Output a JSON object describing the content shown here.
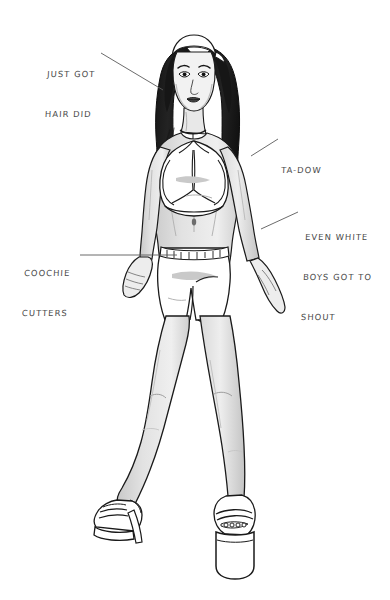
{
  "canvas": {
    "width": 390,
    "height": 600,
    "background_color": "#ffffff",
    "ink_color": "#1a1a1a",
    "annotation_text_color": "#4a4a4a",
    "leader_line_color": "#5a5a5a",
    "skin_shade_color": "#d6d6d6",
    "hair_color": "#1c1c1c",
    "garment_color": "#ffffff"
  },
  "artwork": {
    "title": "Woman in bandana, halter top and short shorts",
    "medium": "black and white ink illustration",
    "subject_parts": [
      "bandana-headband",
      "long-straight-hair",
      "face",
      "choker-necklace",
      "halter-crop-top",
      "midriff",
      "navel",
      "belted-shorts",
      "left-arm",
      "right-arm",
      "left-hand",
      "right-hand",
      "left-leg",
      "right-leg",
      "left-platform-heel",
      "right-platform-heel"
    ]
  },
  "annotations": [
    {
      "id": "just-got-hair-did",
      "lines": [
        "JUST GOT",
        "HAIR DID"
      ],
      "points_to": "long-straight-hair",
      "leader": {
        "x1": 101,
        "y1": 53,
        "x2": 163,
        "y2": 90
      }
    },
    {
      "id": "ta-dow",
      "lines": [
        "TA-DOW"
      ],
      "points_to": "halter-crop-top",
      "leader": {
        "x1": 251,
        "y1": 156,
        "x2": 278,
        "y2": 139
      }
    },
    {
      "id": "even-white-boys-got-to-shout",
      "lines": [
        "EVEN WHITE",
        "BOYS GOT TO",
        "SHOUT"
      ],
      "points_to": "right-hip",
      "leader": {
        "x1": 261,
        "y1": 229,
        "x2": 298,
        "y2": 212
      }
    },
    {
      "id": "coochie-cutters",
      "lines": [
        "COOCHIE",
        "CUTTERS"
      ],
      "points_to": "belted-shorts",
      "leader": {
        "x1": 80,
        "y1": 255,
        "x2": 177,
        "y2": 255
      }
    }
  ]
}
